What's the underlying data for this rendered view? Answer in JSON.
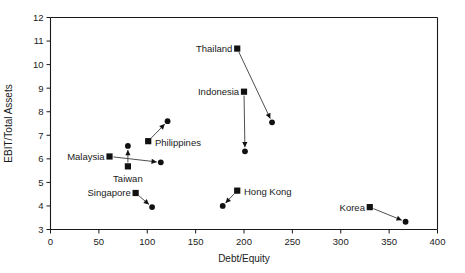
{
  "chart_data": {
    "type": "scatter",
    "title": "",
    "subtitle": "",
    "xlabel": "Debt/Equity",
    "ylabel": "EBIT/Total Assets",
    "xlim": [
      0,
      400
    ],
    "ylim": [
      3,
      12
    ],
    "xticks": [
      0,
      50,
      100,
      150,
      200,
      250,
      300,
      350,
      400
    ],
    "yticks": [
      3,
      4,
      5,
      6,
      7,
      8,
      9,
      10,
      11,
      12
    ],
    "xtick_labels": [
      "0",
      "50",
      "100",
      "150",
      "200",
      "250",
      "300",
      "350",
      "400"
    ],
    "ytick_labels": [
      "3",
      "4",
      "5",
      "6",
      "7",
      "8",
      "9",
      "10",
      "11",
      "12"
    ],
    "grid": false,
    "legend": "none",
    "marker_start": "square",
    "marker_end": "circle",
    "connector": "arrow",
    "note": "Each economy is shown as a pair of points connected by an arrow: square = start value, circle = end value.",
    "series": [
      {
        "name": "Malaysia",
        "label": "Malaysia",
        "label_anchor": "end",
        "label_x": 56,
        "label_y": 6.1,
        "start": {
          "x": 61,
          "y": 6.1
        },
        "end": {
          "x": 114,
          "y": 5.85
        }
      },
      {
        "name": "Taiwan",
        "label": "Taiwan",
        "label_anchor": "middle",
        "label_x": 80,
        "label_y": 5.18,
        "start": {
          "x": 80,
          "y": 5.68
        },
        "end": {
          "x": 80,
          "y": 6.55
        }
      },
      {
        "name": "Philippines",
        "label": "Philippines",
        "label_anchor": "start",
        "label_x": 108,
        "label_y": 6.68,
        "start": {
          "x": 101,
          "y": 6.75
        },
        "end": {
          "x": 121,
          "y": 7.6
        }
      },
      {
        "name": "Singapore",
        "label": "Singapore",
        "label_anchor": "end",
        "label_x": 83,
        "label_y": 4.55,
        "start": {
          "x": 88,
          "y": 4.55
        },
        "end": {
          "x": 105,
          "y": 3.95
        }
      },
      {
        "name": "Thailand",
        "label": "Thailand",
        "label_anchor": "end",
        "label_x": 188,
        "label_y": 10.68,
        "start": {
          "x": 193,
          "y": 10.68
        },
        "end": {
          "x": 229,
          "y": 7.55
        }
      },
      {
        "name": "Indonesia",
        "label": "Indonesia",
        "label_anchor": "end",
        "label_x": 195,
        "label_y": 8.85,
        "start": {
          "x": 200,
          "y": 8.85
        },
        "end": {
          "x": 201,
          "y": 6.32
        }
      },
      {
        "name": "Hong Kong",
        "label": "Hong Kong",
        "label_anchor": "start",
        "label_x": 200,
        "label_y": 4.62,
        "start": {
          "x": 193,
          "y": 4.65
        },
        "end": {
          "x": 178,
          "y": 4.0
        }
      },
      {
        "name": "Korea",
        "label": "Korea",
        "label_anchor": "end",
        "label_x": 325,
        "label_y": 3.95,
        "start": {
          "x": 330,
          "y": 3.95
        },
        "end": {
          "x": 367,
          "y": 3.33
        }
      }
    ]
  }
}
